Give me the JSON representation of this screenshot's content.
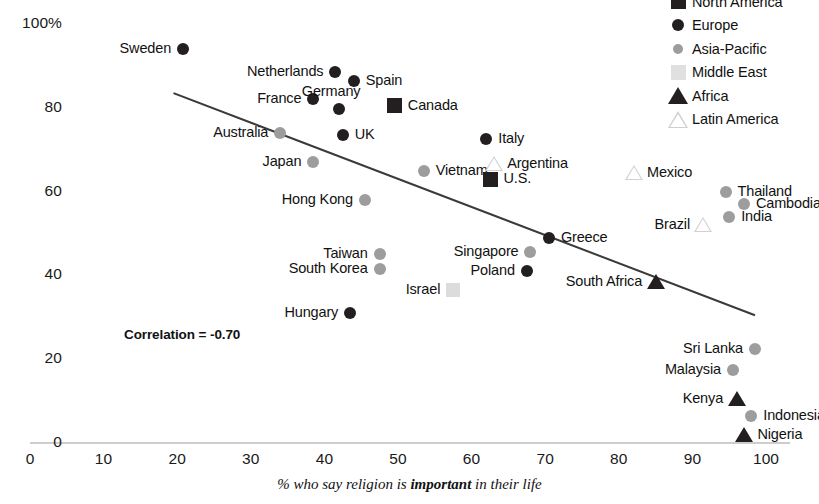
{
  "chart_data": {
    "type": "scatter",
    "title": "",
    "xlabel_parts": [
      "% who say religion is ",
      "important",
      " in their life"
    ],
    "xlabel": "% who say religion is important in their life",
    "ylabel": "",
    "xlim": [
      0,
      100
    ],
    "ylim": [
      0,
      100
    ],
    "xticks": [
      "0",
      "10",
      "20",
      "30",
      "40",
      "50",
      "60",
      "70",
      "80",
      "90",
      "100"
    ],
    "yticks": [
      "100%",
      "80",
      "60",
      "40",
      "20",
      "0"
    ],
    "grid": false,
    "annotation": "Correlation = -0.70",
    "trendline": {
      "x0": 19.5,
      "y0": 83.5,
      "x1": 98.5,
      "y1": 30.5
    },
    "legend": {
      "position": "top-right",
      "entries": [
        {
          "label": "North America",
          "marker": "square",
          "color": "#231f20"
        },
        {
          "label": "Europe",
          "marker": "circle",
          "color": "#231f20"
        },
        {
          "label": "Asia-Pacific",
          "marker": "circle",
          "color": "#9d9d9d"
        },
        {
          "label": "Middle East",
          "marker": "square",
          "color": "#e0e0e0"
        },
        {
          "label": "Africa",
          "marker": "triangle",
          "color": "#231f20"
        },
        {
          "label": "Latin America",
          "marker": "triangle",
          "color": "#cfcfcf"
        }
      ]
    },
    "points": [
      {
        "name": "Sweden",
        "x": 20.8,
        "y": 94.0,
        "group": "Europe",
        "marker": "circle",
        "color": "#231f20",
        "size": 12,
        "label_side": "left"
      },
      {
        "name": "Netherlands",
        "x": 41.5,
        "y": 88.5,
        "group": "Europe",
        "marker": "circle",
        "color": "#231f20",
        "size": 12,
        "label_side": "left"
      },
      {
        "name": "Spain",
        "x": 44.0,
        "y": 86.5,
        "group": "Europe",
        "marker": "circle",
        "color": "#231f20",
        "size": 12,
        "label_side": "right"
      },
      {
        "name": "France",
        "x": 38.5,
        "y": 82.0,
        "group": "Europe",
        "marker": "circle",
        "color": "#231f20",
        "size": 12,
        "label_side": "left"
      },
      {
        "name": "Germany",
        "x": 42.0,
        "y": 79.8,
        "group": "Europe",
        "marker": "circle",
        "color": "#231f20",
        "size": 12,
        "label_side": "above"
      },
      {
        "name": "Canada",
        "x": 49.5,
        "y": 80.5,
        "group": "North America",
        "marker": "square",
        "color": "#231f20",
        "size": 15,
        "label_side": "right"
      },
      {
        "name": "Australia",
        "x": 34.0,
        "y": 74.0,
        "group": "Asia-Pacific",
        "marker": "circle",
        "color": "#9d9d9d",
        "size": 12,
        "label_side": "left"
      },
      {
        "name": "UK",
        "x": 42.5,
        "y": 73.5,
        "group": "Europe",
        "marker": "circle",
        "color": "#231f20",
        "size": 12,
        "label_side": "right"
      },
      {
        "name": "Italy",
        "x": 62.0,
        "y": 72.5,
        "group": "Europe",
        "marker": "circle",
        "color": "#231f20",
        "size": 12,
        "label_side": "right"
      },
      {
        "name": "Japan",
        "x": 38.5,
        "y": 67.0,
        "group": "Asia-Pacific",
        "marker": "circle",
        "color": "#9d9d9d",
        "size": 12,
        "label_side": "left"
      },
      {
        "name": "Vietnam",
        "x": 53.5,
        "y": 65.0,
        "group": "Asia-Pacific",
        "marker": "circle",
        "color": "#9d9d9d",
        "size": 12,
        "label_side": "right"
      },
      {
        "name": "Argentina",
        "x": 63.0,
        "y": 66.5,
        "group": "Latin America",
        "marker": "triangle",
        "color": "#d2d2d2",
        "size": 15,
        "label_side": "right"
      },
      {
        "name": "U.S.",
        "x": 62.5,
        "y": 63.0,
        "group": "North America",
        "marker": "square",
        "color": "#231f20",
        "size": 15,
        "label_side": "right"
      },
      {
        "name": "Mexico",
        "x": 82.0,
        "y": 64.5,
        "group": "Latin America",
        "marker": "triangle",
        "color": "#d2d2d2",
        "size": 15,
        "label_side": "right"
      },
      {
        "name": "Thailand",
        "x": 94.5,
        "y": 60.0,
        "group": "Asia-Pacific",
        "marker": "circle",
        "color": "#9d9d9d",
        "size": 12,
        "label_side": "right"
      },
      {
        "name": "Hong Kong",
        "x": 45.5,
        "y": 58.0,
        "group": "Asia-Pacific",
        "marker": "circle",
        "color": "#9d9d9d",
        "size": 12,
        "label_side": "left"
      },
      {
        "name": "Cambodia",
        "x": 97.0,
        "y": 57.0,
        "group": "Asia-Pacific",
        "marker": "circle",
        "color": "#9d9d9d",
        "size": 12,
        "label_side": "right"
      },
      {
        "name": "India",
        "x": 95.0,
        "y": 54.0,
        "group": "Asia-Pacific",
        "marker": "circle",
        "color": "#9d9d9d",
        "size": 12,
        "label_side": "right"
      },
      {
        "name": "Brazil",
        "x": 91.5,
        "y": 52.0,
        "group": "Latin America",
        "marker": "triangle",
        "color": "#d2d2d2",
        "size": 15,
        "label_side": "left"
      },
      {
        "name": "Greece",
        "x": 70.5,
        "y": 49.0,
        "group": "Europe",
        "marker": "circle",
        "color": "#231f20",
        "size": 12,
        "label_side": "right"
      },
      {
        "name": "Singapore",
        "x": 68.0,
        "y": 45.5,
        "group": "Asia-Pacific",
        "marker": "circle",
        "color": "#9d9d9d",
        "size": 12,
        "label_side": "left"
      },
      {
        "name": "Taiwan",
        "x": 47.5,
        "y": 45.0,
        "group": "Asia-Pacific",
        "marker": "circle",
        "color": "#9d9d9d",
        "size": 12,
        "label_side": "left"
      },
      {
        "name": "South Korea",
        "x": 47.5,
        "y": 41.5,
        "group": "Asia-Pacific",
        "marker": "circle",
        "color": "#9d9d9d",
        "size": 12,
        "label_side": "left"
      },
      {
        "name": "Poland",
        "x": 67.5,
        "y": 41.0,
        "group": "Europe",
        "marker": "circle",
        "color": "#231f20",
        "size": 12,
        "label_side": "left"
      },
      {
        "name": "South Africa",
        "x": 85.0,
        "y": 38.5,
        "group": "Africa",
        "marker": "triangle",
        "color": "#231f20",
        "size": 15,
        "label_side": "left"
      },
      {
        "name": "Israel",
        "x": 57.5,
        "y": 36.5,
        "group": "Middle East",
        "marker": "square",
        "color": "#dcdcdc",
        "size": 14,
        "label_side": "left"
      },
      {
        "name": "Hungary",
        "x": 43.5,
        "y": 31.0,
        "group": "Europe",
        "marker": "circle",
        "color": "#231f20",
        "size": 12,
        "label_side": "left"
      },
      {
        "name": "Sri Lanka",
        "x": 98.5,
        "y": 22.5,
        "group": "Asia-Pacific",
        "marker": "circle",
        "color": "#9d9d9d",
        "size": 12,
        "label_side": "left"
      },
      {
        "name": "Malaysia",
        "x": 95.5,
        "y": 17.5,
        "group": "Asia-Pacific",
        "marker": "circle",
        "color": "#9d9d9d",
        "size": 12,
        "label_side": "left"
      },
      {
        "name": "Kenya",
        "x": 96.0,
        "y": 10.5,
        "group": "Africa",
        "marker": "triangle",
        "color": "#231f20",
        "size": 15,
        "label_side": "left"
      },
      {
        "name": "Indonesia",
        "x": 98.0,
        "y": 6.5,
        "group": "Asia-Pacific",
        "marker": "circle",
        "color": "#9d9d9d",
        "size": 12,
        "label_side": "right"
      },
      {
        "name": "Nigeria",
        "x": 97.0,
        "y": 2.0,
        "group": "Africa",
        "marker": "triangle",
        "color": "#231f20",
        "size": 15,
        "label_side": "right"
      }
    ]
  }
}
